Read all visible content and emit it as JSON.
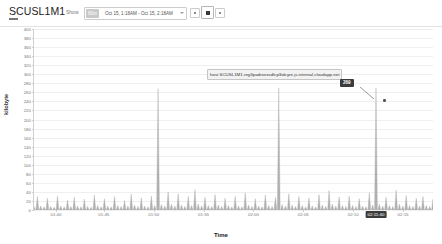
{
  "header": {
    "title": "SCUSL1M1",
    "show_label": "Show",
    "range_tag": "60m",
    "range_text": "Oct 15, 1:18AM - Oct 15, 2:18AM",
    "buttons": [
      {
        "name": "zoom-out-button",
        "label": ""
      },
      {
        "name": "reset-zoom-button",
        "label": ""
      },
      {
        "name": "zoom-in-button",
        "label": ""
      }
    ]
  },
  "tooltip": {
    "series_name": "host.SCUSL1M1.reg3padroexsdlcp3idcyre.js.internal.cloudapp.net",
    "value": "269"
  },
  "axis": {
    "highlighted_time": "02:11:40"
  },
  "chart_data": {
    "type": "area",
    "title": "",
    "xlabel": "Time",
    "ylabel": "kilobyte",
    "ylim": [
      0,
      400
    ],
    "yticks": [
      0,
      20,
      40,
      60,
      80,
      100,
      120,
      140,
      160,
      180,
      200,
      220,
      240,
      260,
      280,
      300,
      320,
      340,
      360,
      380,
      400
    ],
    "grid": true,
    "legend": "none",
    "xticks": [
      "01:40",
      "01:45",
      "01:50",
      "01:55",
      "02:00",
      "02:05",
      "02:10",
      "02:15"
    ],
    "xtick_positions": [
      0.055,
      0.175,
      0.3,
      0.425,
      0.55,
      0.675,
      0.8,
      0.925
    ],
    "series": [
      {
        "name": "host.SCUSL1M1.reg3padroexsdlcp3idcyre.js.internal.cloudapp.net",
        "color": "#b0b0b0",
        "x": [
          0,
          1,
          2,
          3,
          4,
          5,
          6,
          7,
          8,
          9,
          10,
          11,
          12,
          13,
          14,
          15,
          16,
          17,
          18,
          19,
          20,
          21,
          22,
          23,
          24,
          25,
          26,
          27,
          28,
          29,
          30,
          31,
          32,
          33,
          34,
          35,
          36,
          37,
          38,
          39,
          40,
          41,
          42,
          43,
          44,
          45,
          46,
          47,
          48,
          49,
          50,
          51,
          52,
          53,
          54,
          55,
          56,
          57,
          58,
          59,
          60,
          61,
          62,
          63,
          64,
          65,
          66,
          67,
          68,
          69,
          70,
          71,
          72,
          73,
          74,
          75,
          76,
          77,
          78,
          79,
          80,
          81,
          82,
          83,
          84,
          85,
          86,
          87,
          88,
          89,
          90,
          91,
          92,
          93,
          94,
          95,
          96,
          97,
          98,
          99,
          100,
          101,
          102,
          103,
          104,
          105,
          106,
          107,
          108,
          109,
          110,
          111,
          112,
          113,
          114,
          115,
          116,
          117,
          118,
          119
        ],
        "values": [
          8,
          30,
          9,
          7,
          26,
          8,
          6,
          31,
          9,
          7,
          22,
          8,
          28,
          9,
          7,
          24,
          8,
          6,
          33,
          10,
          7,
          25,
          9,
          7,
          30,
          10,
          8,
          21,
          9,
          35,
          11,
          8,
          27,
          9,
          7,
          31,
          10,
          268,
          12,
          9,
          40,
          13,
          9,
          36,
          11,
          8,
          30,
          10,
          45,
          13,
          9,
          28,
          10,
          8,
          34,
          11,
          8,
          26,
          10,
          7,
          30,
          9,
          7,
          38,
          11,
          8,
          25,
          9,
          7,
          33,
          10,
          8,
          28,
          270,
          12,
          9,
          36,
          11,
          8,
          30,
          10,
          7,
          27,
          9,
          7,
          34,
          11,
          8,
          43,
          13,
          9,
          29,
          10,
          8,
          31,
          10,
          8,
          25,
          9,
          7,
          38,
          11,
          269,
          13,
          9,
          28,
          10,
          8,
          44,
          13,
          9,
          32,
          10,
          8,
          26,
          9,
          30,
          10,
          8,
          24
        ]
      }
    ],
    "peaks": [
      {
        "index": 37,
        "value": 268
      },
      {
        "index": 73,
        "value": 270
      },
      {
        "index": 102,
        "value": 269
      }
    ]
  }
}
